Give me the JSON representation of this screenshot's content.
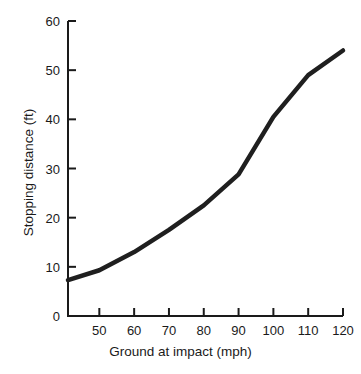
{
  "chart_data": {
    "type": "line",
    "title": "",
    "subtitle": "",
    "xlabel": "Ground at impact (mph)",
    "ylabel": "Stopping distance (ft)",
    "xlim": [
      41,
      120
    ],
    "ylim": [
      0,
      60
    ],
    "grid": false,
    "legend": null,
    "line_color": "#1f1f1f",
    "line_width_px": 4.5,
    "x_ticks": [
      50,
      60,
      70,
      80,
      90,
      100,
      110,
      120
    ],
    "x_tick_labels": [
      "50",
      "60",
      "70",
      "80",
      "90",
      "100",
      "110",
      "120"
    ],
    "y_ticks": [
      0,
      10,
      20,
      30,
      40,
      50,
      60
    ],
    "y_tick_labels": [
      "0",
      "10",
      "20",
      "30",
      "40",
      "50",
      "60"
    ],
    "series": [
      {
        "name": "Stopping distance",
        "x": [
          41,
          50,
          60,
          70,
          80,
          90,
          100,
          110,
          120
        ],
        "values": [
          7.3,
          9.3,
          13.0,
          17.5,
          22.5,
          28.8,
          40.5,
          49.0,
          54.0
        ]
      }
    ],
    "annotations": []
  }
}
